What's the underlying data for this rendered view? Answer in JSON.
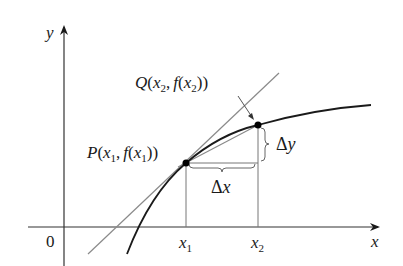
{
  "figure": {
    "axes": {
      "x_label": "x",
      "y_label": "y",
      "origin_label": "0"
    },
    "points": {
      "P": {
        "name": "P",
        "label_prefix": "P",
        "arg": "x",
        "sub": "1",
        "label": "P(x₁, f(x₁))"
      },
      "Q": {
        "name": "Q",
        "label_prefix": "Q",
        "arg": "x",
        "sub": "2",
        "label": "Q(x₂, f(x₂))"
      }
    },
    "ticks": {
      "x1": {
        "base": "x",
        "sub": "1"
      },
      "x2": {
        "base": "x",
        "sub": "2"
      }
    },
    "increments": {
      "dx": {
        "delta": "Δ",
        "var": "x"
      },
      "dy": {
        "delta": "Δ",
        "var": "y"
      }
    },
    "text": {
      "f": "f",
      "open": "(",
      "close": ")",
      "comma": ","
    },
    "colors": {
      "curve": "#1a1a1a",
      "axis": "#333333",
      "tangent": "#8a8a8a",
      "secant": "#8a8a8a",
      "guide": "#777777",
      "brace": "#666666"
    }
  }
}
